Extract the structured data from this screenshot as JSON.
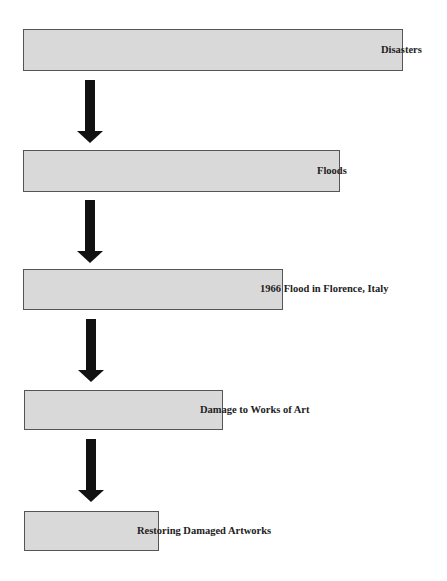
{
  "diagram": {
    "type": "flowchart",
    "direction": "top-to-bottom",
    "colors": {
      "box_fill": "#d9d9d9",
      "box_border": "#555555",
      "arrow": "#111111",
      "text": "#222222"
    },
    "nodes": [
      {
        "id": 1,
        "label": "Disasters"
      },
      {
        "id": 2,
        "label": "Floods"
      },
      {
        "id": 3,
        "label": "1966 Flood in Florence, Italy"
      },
      {
        "id": 4,
        "label": "Damage to Works of Art"
      },
      {
        "id": 5,
        "label": "Restoring Damaged Artworks"
      }
    ],
    "edges": [
      {
        "from": 1,
        "to": 2
      },
      {
        "from": 2,
        "to": 3
      },
      {
        "from": 3,
        "to": 4
      },
      {
        "from": 4,
        "to": 5
      }
    ]
  }
}
